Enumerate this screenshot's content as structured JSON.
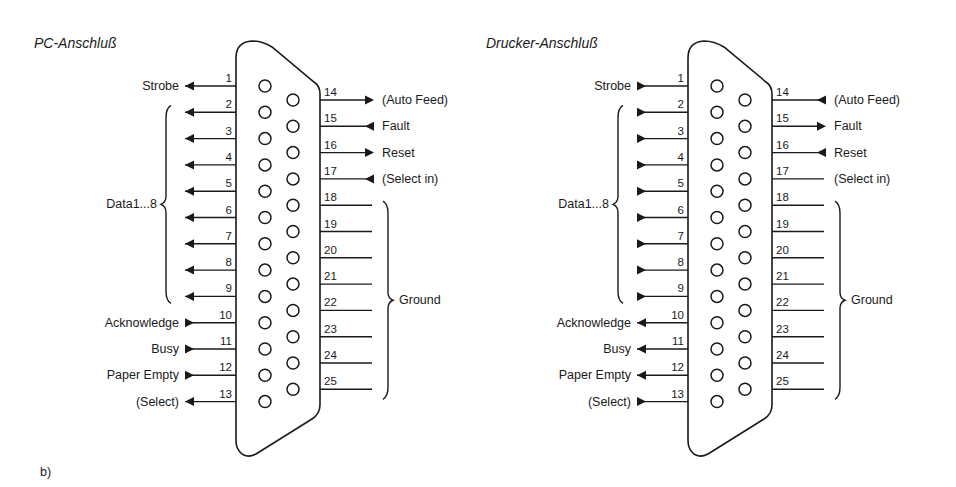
{
  "figure_label": "b)",
  "connectors": [
    {
      "id": "pc",
      "title": "PC-Anschluß",
      "offset_x": 0,
      "left_pins": [
        {
          "pin": "1",
          "label": "Strobe",
          "arrow": "out"
        },
        {
          "pin": "2",
          "label": "",
          "arrow": "out"
        },
        {
          "pin": "3",
          "label": "",
          "arrow": "out"
        },
        {
          "pin": "4",
          "label": "",
          "arrow": "out"
        },
        {
          "pin": "5",
          "label": "",
          "arrow": "out"
        },
        {
          "pin": "6",
          "label": "",
          "arrow": "out"
        },
        {
          "pin": "7",
          "label": "",
          "arrow": "out"
        },
        {
          "pin": "8",
          "label": "",
          "arrow": "out"
        },
        {
          "pin": "9",
          "label": "",
          "arrow": "out"
        },
        {
          "pin": "10",
          "label": "Acknowledge",
          "arrow": "in"
        },
        {
          "pin": "11",
          "label": "Busy",
          "arrow": "in"
        },
        {
          "pin": "12",
          "label": "Paper Empty",
          "arrow": "in"
        },
        {
          "pin": "13",
          "label": "(Select)",
          "arrow": "out"
        }
      ],
      "right_pins": [
        {
          "pin": "14",
          "label": "(Auto Feed)",
          "arrow": "out"
        },
        {
          "pin": "15",
          "label": "Fault",
          "arrow": "in"
        },
        {
          "pin": "16",
          "label": "Reset",
          "arrow": "out"
        },
        {
          "pin": "17",
          "label": "(Select in)",
          "arrow": "in"
        },
        {
          "pin": "18",
          "label": "",
          "arrow": "none"
        },
        {
          "pin": "19",
          "label": "",
          "arrow": "none"
        },
        {
          "pin": "20",
          "label": "",
          "arrow": "none"
        },
        {
          "pin": "21",
          "label": "",
          "arrow": "none"
        },
        {
          "pin": "22",
          "label": "",
          "arrow": "none"
        },
        {
          "pin": "23",
          "label": "",
          "arrow": "none"
        },
        {
          "pin": "24",
          "label": "",
          "arrow": "none"
        },
        {
          "pin": "25",
          "label": "",
          "arrow": "none"
        }
      ],
      "data_group_label": "Data1...8",
      "ground_group_label": "Ground"
    },
    {
      "id": "printer",
      "title": "Drucker-Anschluß",
      "offset_x": 452,
      "left_pins": [
        {
          "pin": "1",
          "label": "Strobe",
          "arrow": "in"
        },
        {
          "pin": "2",
          "label": "",
          "arrow": "in"
        },
        {
          "pin": "3",
          "label": "",
          "arrow": "in"
        },
        {
          "pin": "4",
          "label": "",
          "arrow": "in"
        },
        {
          "pin": "5",
          "label": "",
          "arrow": "in"
        },
        {
          "pin": "6",
          "label": "",
          "arrow": "in"
        },
        {
          "pin": "7",
          "label": "",
          "arrow": "in"
        },
        {
          "pin": "8",
          "label": "",
          "arrow": "in"
        },
        {
          "pin": "9",
          "label": "",
          "arrow": "in"
        },
        {
          "pin": "10",
          "label": "Acknowledge",
          "arrow": "out"
        },
        {
          "pin": "11",
          "label": "Busy",
          "arrow": "out"
        },
        {
          "pin": "12",
          "label": "Paper Empty",
          "arrow": "out"
        },
        {
          "pin": "13",
          "label": "(Select)",
          "arrow": "in"
        }
      ],
      "right_pins": [
        {
          "pin": "14",
          "label": "(Auto Feed)",
          "arrow": "in"
        },
        {
          "pin": "15",
          "label": "Fault",
          "arrow": "out"
        },
        {
          "pin": "16",
          "label": "Reset",
          "arrow": "in"
        },
        {
          "pin": "17",
          "label": "(Select in)",
          "arrow": "none"
        },
        {
          "pin": "18",
          "label": "",
          "arrow": "none"
        },
        {
          "pin": "19",
          "label": "",
          "arrow": "none"
        },
        {
          "pin": "20",
          "label": "",
          "arrow": "none"
        },
        {
          "pin": "21",
          "label": "",
          "arrow": "none"
        },
        {
          "pin": "22",
          "label": "",
          "arrow": "none"
        },
        {
          "pin": "23",
          "label": "",
          "arrow": "none"
        },
        {
          "pin": "24",
          "label": "",
          "arrow": "none"
        },
        {
          "pin": "25",
          "label": "",
          "arrow": "none"
        }
      ],
      "data_group_label": "Data1...8",
      "ground_group_label": "Ground"
    }
  ]
}
